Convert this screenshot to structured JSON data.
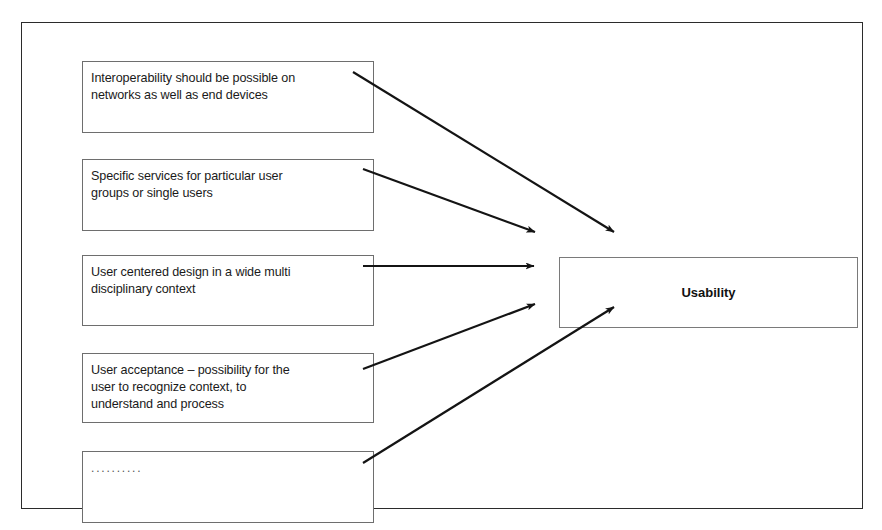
{
  "diagram": {
    "title_box": {
      "label": "Usability",
      "name": "usability-box"
    },
    "factors": [
      {
        "id": "factor-interoperability",
        "text": "Interoperability should be possible on\nnetworks as well as end devices"
      },
      {
        "id": "factor-specific-services",
        "text": "Specific services for particular user\ngroups or single users"
      },
      {
        "id": "factor-user-centered-design",
        "text": "User centered design in a wide multi\ndisciplinary context"
      },
      {
        "id": "factor-user-acceptance",
        "text": "User acceptance – possibility for the\nuser to recognize context, to\nunderstand and process"
      },
      {
        "id": "factor-more",
        "text": ".........."
      }
    ],
    "arrows": [
      {
        "name": "arrow-interoperability-to-usability",
        "from": [
          353,
          72
        ],
        "to": [
          614,
          232
        ]
      },
      {
        "name": "arrow-specific-services-to-usability",
        "from": [
          363,
          169
        ],
        "to": [
          535,
          232
        ]
      },
      {
        "name": "arrow-user-centered-design-to-usability",
        "from": [
          363,
          266
        ],
        "to": [
          534,
          266
        ]
      },
      {
        "name": "arrow-user-acceptance-to-usability",
        "from": [
          363,
          369
        ],
        "to": [
          535,
          304
        ]
      },
      {
        "name": "arrow-more-to-usability",
        "from": [
          363,
          463
        ],
        "to": [
          614,
          307
        ]
      }
    ],
    "colors": {
      "frame_border": "#2b2b2b",
      "box_border": "#6e6e6e",
      "arrow": "#141414",
      "text": "#1a1a1a",
      "background": "#ffffff"
    }
  }
}
